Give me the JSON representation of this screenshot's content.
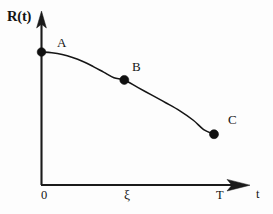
{
  "figure": {
    "background_color": "#fdfdfd",
    "ink_color": "#151515",
    "axes": {
      "y_axis_title": "R(t)",
      "x_axis_title": "t",
      "x_ticks": [
        {
          "label": "0",
          "value": 0
        },
        {
          "label": "ξ",
          "value": 0.48
        },
        {
          "label": "T",
          "value": 1.0
        }
      ],
      "y_ticks": []
    },
    "point_labels": [
      {
        "name": "A",
        "label": "A"
      },
      {
        "name": "B",
        "label": "B"
      },
      {
        "name": "C",
        "label": "C"
      }
    ]
  },
  "chart_data": {
    "type": "line",
    "title": "",
    "subtitle": "",
    "xlabel": "t",
    "ylabel": "R(t)",
    "xlim": [
      0,
      1.15
    ],
    "ylim": [
      0,
      1.0
    ],
    "grid": false,
    "legend": "none",
    "x_tick_labels": [
      "0",
      "ξ",
      "T"
    ],
    "x_tick_values": [
      0,
      0.48,
      1.0
    ],
    "y_tick_labels": [],
    "series": [
      {
        "name": "R(t)",
        "type": "line",
        "x": [
          0.0,
          0.06,
          0.12,
          0.18,
          0.24,
          0.3,
          0.36,
          0.42,
          0.48,
          0.56,
          0.64,
          0.72,
          0.8,
          0.88,
          0.94,
          1.0
        ],
        "y": [
          1.0,
          0.995,
          0.984,
          0.965,
          0.939,
          0.906,
          0.87,
          0.834,
          0.82,
          0.77,
          0.722,
          0.673,
          0.622,
          0.56,
          0.5,
          0.47
        ],
        "markers": [
          {
            "label": "A",
            "x": 0.0,
            "y": 1.0
          },
          {
            "label": "B",
            "x": 0.48,
            "y": 0.82
          },
          {
            "label": "C",
            "x": 1.0,
            "y": 0.47
          }
        ]
      }
    ],
    "annotations": [
      {
        "text": "A",
        "x": 0.0,
        "y": 1.0,
        "placement": "upper-right"
      },
      {
        "text": "B",
        "x": 0.48,
        "y": 0.82,
        "placement": "upper-right"
      },
      {
        "text": "C",
        "x": 1.0,
        "y": 0.47,
        "placement": "upper-right"
      }
    ]
  }
}
